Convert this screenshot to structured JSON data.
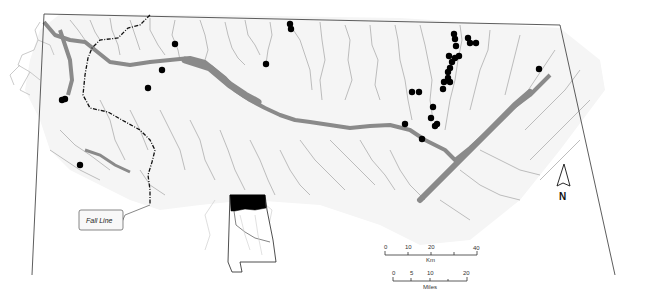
{
  "map": {
    "title": "",
    "region": "Northern Alabama",
    "colors": {
      "background": "#ffffff",
      "land": "#f4f4f4",
      "streams": "#b5b5b5",
      "reservoir": "#8a8a8a",
      "boundary": "#333333",
      "fall_line": "#111111",
      "sites": "#000000",
      "inset_highlight": "#000000"
    },
    "legend": {
      "fall_line_label": "Fall Line",
      "north_label": "N"
    },
    "scale_km": {
      "ticks": [
        "0",
        "10",
        "20",
        "40"
      ],
      "unit_label": "Km"
    },
    "scale_miles": {
      "ticks": [
        "0",
        "5",
        "10",
        "20"
      ],
      "unit_label": "Miles"
    },
    "sites": [
      {
        "id": 1,
        "x": 62,
        "y": 100
      },
      {
        "id": 2,
        "x": 65,
        "y": 99
      },
      {
        "id": 3,
        "x": 175,
        "y": 44
      },
      {
        "id": 4,
        "x": 162,
        "y": 70
      },
      {
        "id": 5,
        "x": 148,
        "y": 88
      },
      {
        "id": 6,
        "x": 290,
        "y": 24
      },
      {
        "id": 7,
        "x": 291,
        "y": 29
      },
      {
        "id": 8,
        "x": 266,
        "y": 64
      },
      {
        "id": 9,
        "x": 80,
        "y": 165
      },
      {
        "id": 10,
        "x": 454,
        "y": 34
      },
      {
        "id": 11,
        "x": 455,
        "y": 39
      },
      {
        "id": 12,
        "x": 468,
        "y": 38
      },
      {
        "id": 13,
        "x": 470,
        "y": 43
      },
      {
        "id": 14,
        "x": 476,
        "y": 43
      },
      {
        "id": 15,
        "x": 456,
        "y": 46
      },
      {
        "id": 16,
        "x": 449,
        "y": 56
      },
      {
        "id": 17,
        "x": 455,
        "y": 58
      },
      {
        "id": 18,
        "x": 459,
        "y": 56
      },
      {
        "id": 19,
        "x": 452,
        "y": 62
      },
      {
        "id": 20,
        "x": 450,
        "y": 68
      },
      {
        "id": 21,
        "x": 448,
        "y": 72
      },
      {
        "id": 22,
        "x": 448,
        "y": 78
      },
      {
        "id": 23,
        "x": 450,
        "y": 82
      },
      {
        "id": 24,
        "x": 444,
        "y": 82
      },
      {
        "id": 25,
        "x": 443,
        "y": 89
      },
      {
        "id": 26,
        "x": 412,
        "y": 92
      },
      {
        "id": 27,
        "x": 419,
        "y": 92
      },
      {
        "id": 28,
        "x": 433,
        "y": 107
      },
      {
        "id": 29,
        "x": 431,
        "y": 118
      },
      {
        "id": 30,
        "x": 437,
        "y": 124
      },
      {
        "id": 31,
        "x": 435,
        "y": 126
      },
      {
        "id": 32,
        "x": 405,
        "y": 124
      },
      {
        "id": 33,
        "x": 422,
        "y": 139
      },
      {
        "id": 34,
        "x": 539,
        "y": 69
      }
    ]
  }
}
